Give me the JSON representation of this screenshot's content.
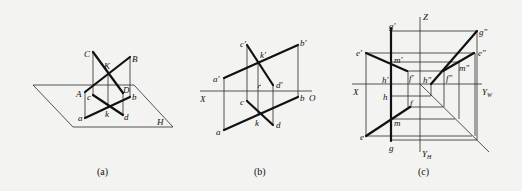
{
  "figure": {
    "panels": [
      {
        "id": "a",
        "caption": "(a)",
        "labels": {
          "C": "C",
          "B": "B",
          "K": "K",
          "A": "A",
          "D": "D",
          "c": "c",
          "b": "b",
          "a": "a",
          "k": "k",
          "d": "d",
          "H": "H"
        }
      },
      {
        "id": "b",
        "caption": "(b)",
        "labels": {
          "c_prime": "c′",
          "b_prime": "b′",
          "k_prime": "k′",
          "a_prime": "a′",
          "d_prime": "d′",
          "X": "X",
          "O": "O",
          "c": "c",
          "b": "b",
          "a": "a",
          "k": "k",
          "d": "d"
        }
      },
      {
        "id": "c",
        "caption": "(c)",
        "labels": {
          "Z": "Z",
          "g_prime": "g′",
          "g_dprime": "g″",
          "e_prime": "e′",
          "e_dprime": "e″",
          "m_prime": "m′",
          "m_dprime": "m″",
          "h_prime": "h′",
          "h_dprime": "h″",
          "f_prime": "f′",
          "f_dprime": "f″",
          "X": "X",
          "Y_W": "Y",
          "Y_W_sub": "W",
          "h": "h",
          "f": "f",
          "m": "m",
          "e": "e",
          "g": "g",
          "Y_H": "Y",
          "Y_H_sub": "H"
        }
      }
    ]
  }
}
